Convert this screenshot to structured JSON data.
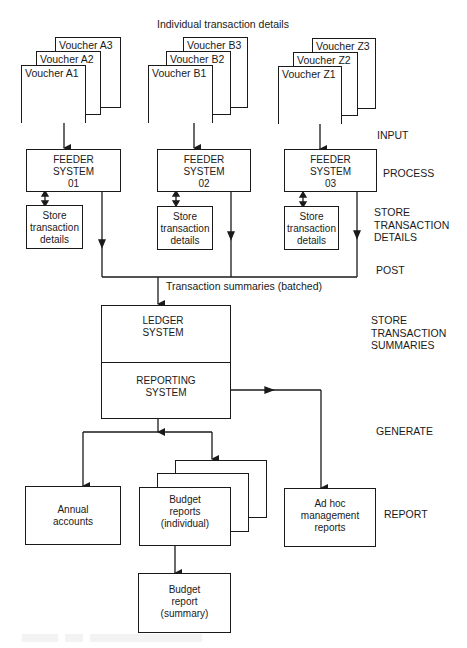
{
  "diagram": {
    "top_label": "Individual transaction details",
    "transaction_summaries_label": "Transaction summaries (batched)",
    "voucher_groups": [
      {
        "front": "Voucher A1",
        "middle": "Voucher A2",
        "back": "Voucher A3"
      },
      {
        "front": "Voucher B1",
        "middle": "Voucher B2",
        "back": "Voucher B3"
      },
      {
        "front": "Voucher Z1",
        "middle": "Voucher Z2",
        "back": "Voucher Z3"
      }
    ],
    "feeder_systems": [
      {
        "line1": "FEEDER",
        "line2": "SYSTEM",
        "line3": "01"
      },
      {
        "line1": "FEEDER",
        "line2": "SYSTEM",
        "line3": "02"
      },
      {
        "line1": "FEEDER",
        "line2": "SYSTEM",
        "line3": "03"
      }
    ],
    "store_boxes": [
      {
        "line1": "Store",
        "line2": "transaction",
        "line3": "details"
      },
      {
        "line1": "Store",
        "line2": "transaction",
        "line3": "details"
      },
      {
        "line1": "Store",
        "line2": "transaction",
        "line3": "details"
      }
    ],
    "ledger": {
      "line1": "LEDGER",
      "line2": "SYSTEM"
    },
    "reporting": {
      "line1": "REPORTING",
      "line2": "SYSTEM"
    },
    "annual_accounts": {
      "line1": "Annual",
      "line2": "accounts"
    },
    "budget_individual": {
      "line1": "Budget",
      "line2": "reports",
      "line3": "(individual)"
    },
    "budget_summary": {
      "line1": "Budget",
      "line2": "report",
      "line3": "(summary)"
    },
    "adhoc": {
      "line1": "Ad hoc",
      "line2": "management",
      "line3": "reports"
    },
    "stages": {
      "input": "INPUT",
      "process": "PROCESS",
      "store_details": {
        "line1": "STORE",
        "line2": "TRANSACTION",
        "line3": "DETAILS"
      },
      "post": "POST",
      "store_summaries": {
        "line1": "STORE",
        "line2": "TRANSACTION",
        "line3": "SUMMARIES"
      },
      "generate": "GENERATE",
      "report": "REPORT"
    }
  }
}
